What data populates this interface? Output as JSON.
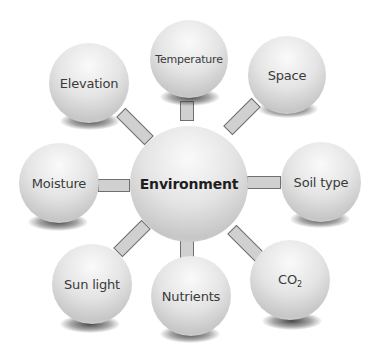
{
  "diagram": {
    "type": "hub-and-spoke",
    "center": {
      "label": "Environment"
    },
    "nodes": [
      {
        "id": "temperature",
        "label": "Temperature"
      },
      {
        "id": "space",
        "label": "Space"
      },
      {
        "id": "soil-type",
        "label": "Soil type"
      },
      {
        "id": "co2",
        "label": "CO",
        "subscript": "2"
      },
      {
        "id": "nutrients",
        "label": "Nutrients"
      },
      {
        "id": "sun-light",
        "label": "Sun light"
      },
      {
        "id": "moisture",
        "label": "Moisture"
      },
      {
        "id": "elevation",
        "label": "Elevation"
      }
    ],
    "colors": {
      "bubble": "#e2e2e2",
      "connector_fill": "#d0d0d0",
      "connector_border": "#6f6f6f",
      "text": "#3a3a3a"
    }
  }
}
